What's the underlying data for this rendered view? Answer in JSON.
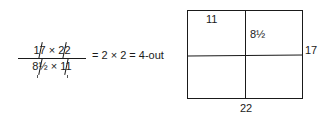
{
  "formula": {
    "numerator": [
      "17",
      "×",
      "22"
    ],
    "denominator": [
      "8½",
      "×",
      "11"
    ],
    "result": "= 2 × 2 = 4-out"
  },
  "sheet_diagram": {
    "top_left_label": "11",
    "inner_label": "8½",
    "right_label": "17",
    "bottom_label": "22"
  }
}
